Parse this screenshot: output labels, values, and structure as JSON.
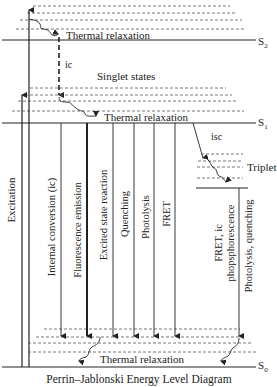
{
  "title": "Perrin–Jablonski Energy Level Diagram",
  "levels": {
    "s2": {
      "label": "S",
      "sub": "2"
    },
    "s1": {
      "label": "S",
      "sub": "1"
    },
    "s0": {
      "label": "S",
      "sub": "0"
    },
    "triplet": "Triplet"
  },
  "labels": {
    "thermal_relaxation_s2": "Thermal relaxation",
    "thermal_relaxation_s1": "Thermal relaxation",
    "thermal_relaxation_s0": "Thermal relaxation",
    "ic": "ic",
    "singlet_states": "Singlet states",
    "isc": "isc"
  },
  "processes": [
    {
      "id": "excitation",
      "label": "Excitation"
    },
    {
      "id": "internal-conversion",
      "label": "Internal conversion (ic)"
    },
    {
      "id": "fluorescence",
      "label": "Fluorescence emission"
    },
    {
      "id": "excited-state-reaction",
      "label": "Excited state reaction"
    },
    {
      "id": "quenching",
      "label": "Quenching"
    },
    {
      "id": "photolysis",
      "label": "Photolysis"
    },
    {
      "id": "fret",
      "label": "FRET"
    },
    {
      "id": "fret-ic-phosphorescence",
      "label_line1": "FRET, ic",
      "label_line2": "phopsphorescence"
    },
    {
      "id": "photolysis-quenching",
      "label": "Photolysis, quenching"
    }
  ],
  "colors": {
    "line": "#222222",
    "dash": "#555555",
    "background": "#ffffff"
  }
}
